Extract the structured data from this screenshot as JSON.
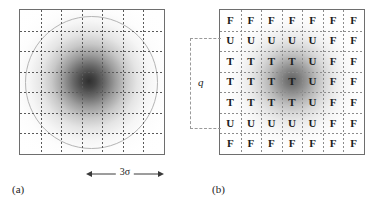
{
  "figure": {
    "background_color": "#ffffff",
    "panels": [
      {
        "id": "a",
        "caption": "(a)",
        "frame_color": "#6e6e6e",
        "description": "Gaussian intensity blob with circle outline and dashed 7x7 grid",
        "grid": {
          "rows": 7,
          "cols": 7,
          "line_style": "dashed",
          "line_color": "#5a5a5a"
        },
        "circle": {
          "stroke_color": "#b4b4b4"
        },
        "scale_annotation": {
          "label": "3σ",
          "arrow": "double-headed",
          "sigma_symbol": "σ",
          "multiplier": "3"
        }
      },
      {
        "id": "b",
        "caption": "(b)",
        "frame_color": "#6e6e6e",
        "description": "Quantised Gaussian blob shown as a 7x7 grid of classification letters",
        "grid": {
          "rows": 7,
          "cols": 7,
          "line_style": "dashed",
          "line_color": "#8c8c8c"
        },
        "bracket": {
          "label": "q",
          "spans_rows": 5,
          "line_style": "dashed",
          "line_color": "#9a9a9a"
        },
        "letters": [
          [
            "F",
            "F",
            "F",
            "F",
            "F",
            "F",
            "F"
          ],
          [
            "U",
            "U",
            "U",
            "U",
            "U",
            "F",
            "F"
          ],
          [
            "T",
            "T",
            "T",
            "T",
            "U",
            "F",
            "F"
          ],
          [
            "T",
            "T",
            "T",
            "T",
            "U",
            "F",
            "F"
          ],
          [
            "T",
            "T",
            "T",
            "T",
            "U",
            "F",
            "F"
          ],
          [
            "U",
            "U",
            "U",
            "U",
            "U",
            "F",
            "F"
          ],
          [
            "F",
            "F",
            "F",
            "F",
            "F",
            "F",
            "F"
          ]
        ],
        "legend_symbols": [
          "T",
          "U",
          "F"
        ]
      }
    ]
  }
}
